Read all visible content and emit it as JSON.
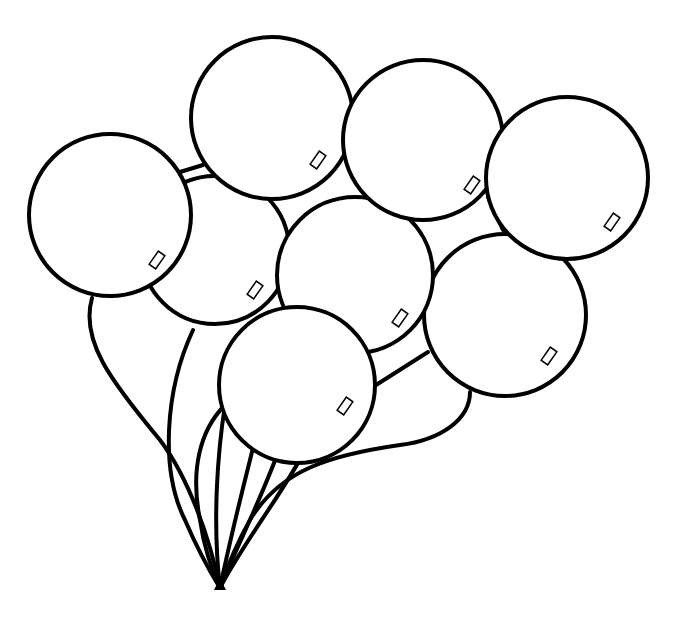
{
  "image": {
    "title": "Bunch of balloons coloring page",
    "description": "Black line-art drawing of eight round balloons tied together with strings meeting at a single point at the bottom",
    "colors": {
      "line": "#000000",
      "fill": "#ffffff",
      "background": "#ffffff"
    },
    "balloon_count": 8,
    "balloons": [
      {
        "id": "b5",
        "cx": 215,
        "cy": 250,
        "r": 74,
        "shine": [
          252,
          292,
          -55
        ]
      },
      {
        "id": "b1",
        "cx": 110,
        "cy": 215,
        "r": 81,
        "shine": [
          156,
          260,
          -55
        ]
      },
      {
        "id": "b7",
        "cx": 505,
        "cy": 315,
        "r": 81,
        "shine": [
          548,
          357,
          -55
        ]
      },
      {
        "id": "b6",
        "cx": 355,
        "cy": 275,
        "r": 78,
        "shine": [
          400,
          318,
          -55
        ]
      },
      {
        "id": "b2",
        "cx": 272,
        "cy": 118,
        "r": 81,
        "shine": [
          318,
          160,
          -55
        ]
      },
      {
        "id": "b3",
        "cx": 423,
        "cy": 140,
        "r": 80,
        "shine": [
          466,
          184,
          -55
        ]
      },
      {
        "id": "b4",
        "cx": 567,
        "cy": 178,
        "r": 81,
        "shine": [
          609,
          222,
          -55
        ]
      },
      {
        "id": "b8",
        "cx": 297,
        "cy": 385,
        "r": 78,
        "shine": [
          344,
          407,
          -55
        ]
      }
    ],
    "knot": {
      "x": 220,
      "y": 588
    }
  }
}
